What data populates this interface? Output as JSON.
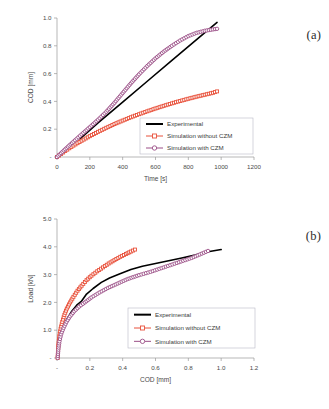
{
  "figure": {
    "panels": [
      {
        "tag": "(a)",
        "xlabel": "Time [s]",
        "ylabel": "COD [mm]"
      },
      {
        "tag": "(b)",
        "xlabel": "COD [mm]",
        "ylabel": "Load [kN]"
      }
    ],
    "legend": {
      "experimental": "Experimental",
      "without_czm": "Simulation without CZM",
      "with_czm": "Simulation with CZM"
    },
    "colors": {
      "experimental": "#000000",
      "without_czm": "#E8503A",
      "with_czm": "#9B4F87",
      "axis": "#9a9a9a",
      "text": "#4a4a4a"
    }
  },
  "chart_data": [
    {
      "type": "line",
      "title": "",
      "panel": "(a)",
      "xlabel": "Time [s]",
      "ylabel": "COD [mm]",
      "xlim": [
        0,
        1200
      ],
      "ylim": [
        0,
        1.0
      ],
      "xticks": [
        0,
        200,
        400,
        600,
        800,
        1000,
        1200
      ],
      "xticklabels": [
        "0",
        "200",
        "400",
        "600",
        "800",
        "1000",
        "1200"
      ],
      "yticks": [
        0,
        0.2,
        0.4,
        0.6,
        0.8,
        1.0
      ],
      "yticklabels": [
        "-",
        "0.2",
        "0.4",
        "0.6",
        "0.8",
        "1.0"
      ],
      "grid": false,
      "legend_position": "lower-right",
      "series": [
        {
          "name": "Experimental",
          "color": "#000000",
          "marker": "none",
          "x": [
            140,
            250,
            400,
            550,
            700,
            850,
            975
          ],
          "y": [
            0.13,
            0.245,
            0.395,
            0.545,
            0.695,
            0.845,
            0.968
          ]
        },
        {
          "name": "Simulation without CZM",
          "color": "#E8503A",
          "marker": "square",
          "x": [
            0,
            25,
            50,
            75,
            100,
            150,
            200,
            250,
            300,
            350,
            400,
            450,
            500,
            550,
            600,
            650,
            700,
            750,
            800,
            850,
            900,
            950,
            975
          ],
          "y": [
            0.0,
            0.022,
            0.043,
            0.063,
            0.082,
            0.117,
            0.15,
            0.181,
            0.21,
            0.237,
            0.262,
            0.286,
            0.308,
            0.329,
            0.349,
            0.368,
            0.386,
            0.403,
            0.419,
            0.434,
            0.448,
            0.462,
            0.472
          ]
        },
        {
          "name": "Simulation with CZM",
          "color": "#9B4F87",
          "marker": "circle",
          "x": [
            0,
            25,
            50,
            75,
            100,
            150,
            200,
            250,
            300,
            350,
            400,
            450,
            500,
            550,
            600,
            650,
            700,
            750,
            800,
            850,
            900,
            950,
            975
          ],
          "y": [
            0.0,
            0.028,
            0.056,
            0.083,
            0.11,
            0.163,
            0.215,
            0.268,
            0.325,
            0.39,
            0.46,
            0.53,
            0.595,
            0.655,
            0.71,
            0.758,
            0.8,
            0.838,
            0.87,
            0.893,
            0.908,
            0.918,
            0.922
          ]
        }
      ]
    },
    {
      "type": "line",
      "title": "",
      "panel": "(b)",
      "xlabel": "COD [mm]",
      "ylabel": "Load [kN]",
      "xlim": [
        0,
        1.2
      ],
      "ylim": [
        0,
        5.0
      ],
      "xticks": [
        0,
        0.2,
        0.4,
        0.6,
        0.8,
        1.0,
        1.2
      ],
      "xticklabels": [
        "-",
        "0.2",
        "0.4",
        "0.6",
        "0.8",
        "1.0",
        "1.2"
      ],
      "yticks": [
        0,
        1.0,
        2.0,
        3.0,
        4.0,
        5.0
      ],
      "yticklabels": [
        "-",
        "1.0",
        "2.0",
        "3.0",
        "4.0",
        "5.0"
      ],
      "grid": false,
      "legend_position": "center-right",
      "series": [
        {
          "name": "Experimental",
          "color": "#000000",
          "marker": "none",
          "x": [
            0.005,
            0.01,
            0.02,
            0.035,
            0.06,
            0.09,
            0.12,
            0.15,
            0.18,
            0.22,
            0.27,
            0.32,
            0.38,
            0.45,
            0.52,
            0.6,
            0.68,
            0.76,
            0.84,
            0.92,
            1.0
          ],
          "y": [
            0.0,
            0.35,
            0.72,
            1.05,
            1.4,
            1.68,
            1.9,
            2.05,
            2.3,
            2.5,
            2.72,
            2.88,
            3.02,
            3.18,
            3.3,
            3.4,
            3.5,
            3.6,
            3.7,
            3.82,
            3.9
          ]
        },
        {
          "name": "Simulation without CZM",
          "color": "#E8503A",
          "marker": "square",
          "x": [
            0.004,
            0.008,
            0.014,
            0.022,
            0.032,
            0.045,
            0.06,
            0.08,
            0.1,
            0.125,
            0.15,
            0.18,
            0.21,
            0.245,
            0.28,
            0.315,
            0.35,
            0.385,
            0.42,
            0.45,
            0.475
          ],
          "y": [
            0.0,
            0.45,
            0.78,
            1.05,
            1.3,
            1.55,
            1.78,
            2.0,
            2.2,
            2.42,
            2.6,
            2.8,
            2.96,
            3.12,
            3.26,
            3.4,
            3.52,
            3.64,
            3.74,
            3.83,
            3.9
          ]
        },
        {
          "name": "Simulation with CZM",
          "color": "#9B4F87",
          "marker": "circle",
          "x": [
            0.004,
            0.008,
            0.015,
            0.025,
            0.04,
            0.058,
            0.08,
            0.105,
            0.135,
            0.17,
            0.21,
            0.26,
            0.31,
            0.37,
            0.43,
            0.5,
            0.57,
            0.65,
            0.73,
            0.82,
            0.92
          ],
          "y": [
            0.0,
            0.3,
            0.6,
            0.85,
            1.08,
            1.3,
            1.5,
            1.68,
            1.85,
            2.0,
            2.18,
            2.36,
            2.52,
            2.68,
            2.84,
            2.98,
            3.1,
            3.26,
            3.42,
            3.6,
            3.85
          ]
        }
      ]
    }
  ]
}
